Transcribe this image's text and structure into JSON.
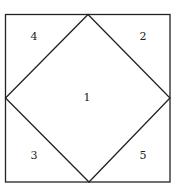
{
  "diagram": {
    "stroke_color": "#222222",
    "background": "#ffffff",
    "regions": [
      {
        "id": "center-diamond",
        "label": "1"
      },
      {
        "id": "top-right-triangle",
        "label": "2"
      },
      {
        "id": "bottom-left-triangle",
        "label": "3"
      },
      {
        "id": "top-left-triangle",
        "label": "4"
      },
      {
        "id": "bottom-right-triangle",
        "label": "5"
      }
    ]
  }
}
